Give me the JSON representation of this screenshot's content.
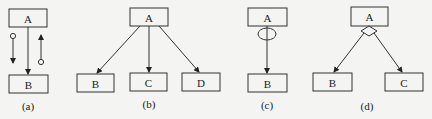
{
  "diagram": {
    "panels": [
      {
        "id": "a",
        "caption": "(a)",
        "nodes": [
          {
            "label": "A"
          },
          {
            "label": "B"
          }
        ],
        "description": "A to B association with two message flows marked by small circles (data couples)"
      },
      {
        "id": "b",
        "caption": "(b)",
        "nodes": [
          {
            "label": "A"
          },
          {
            "label": "B"
          },
          {
            "label": "C"
          },
          {
            "label": "D"
          }
        ],
        "description": "A calls B, C and D sequentially"
      },
      {
        "id": "c",
        "caption": "(c)",
        "nodes": [
          {
            "label": "A"
          },
          {
            "label": "B"
          }
        ],
        "description": "A repeatedly calls B (loop ellipse)"
      },
      {
        "id": "d",
        "caption": "(d)",
        "nodes": [
          {
            "label": "A"
          },
          {
            "label": "B"
          },
          {
            "label": "C"
          }
        ],
        "description": "A conditionally calls B or C (selection diamond)"
      }
    ]
  }
}
